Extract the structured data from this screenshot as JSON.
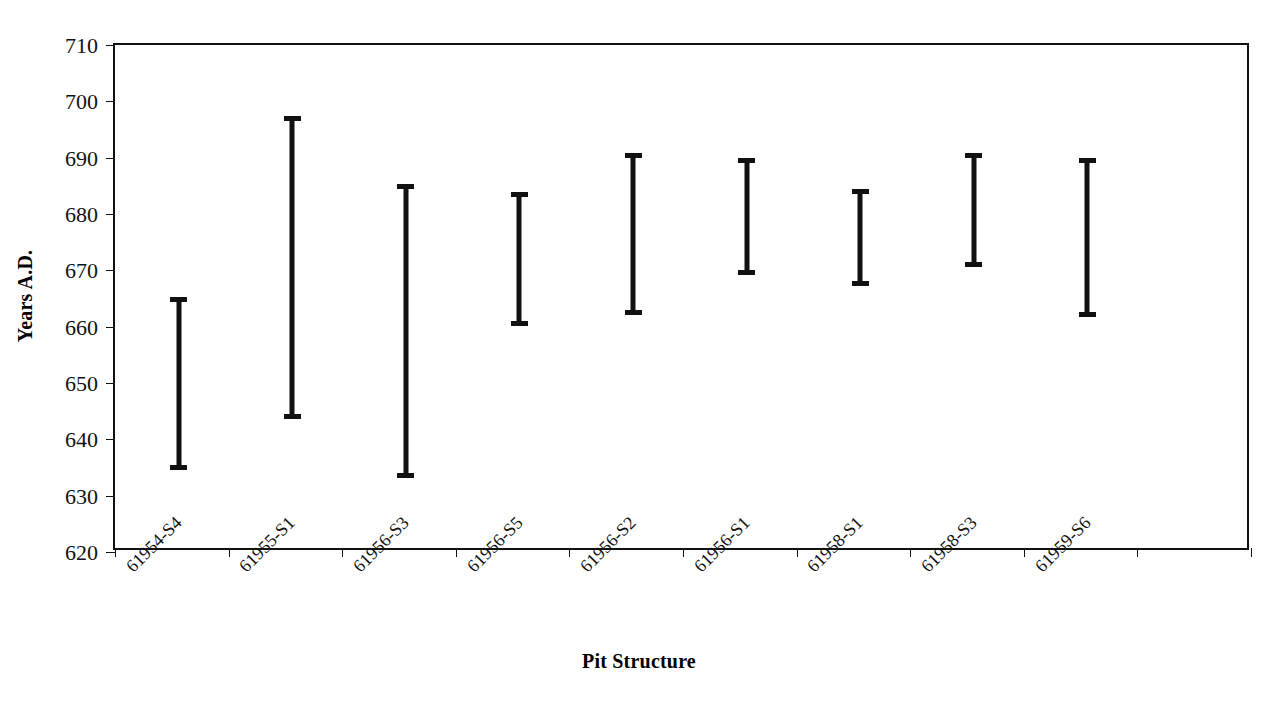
{
  "chart_data": {
    "type": "bar",
    "title": "",
    "xlabel": "Pit Structure",
    "ylabel": "Years A.D.",
    "ylim": [
      620,
      710
    ],
    "ytick_step": 10,
    "yticks": [
      710,
      700,
      690,
      680,
      670,
      660,
      650,
      640,
      630,
      620
    ],
    "grid": false,
    "legend": null,
    "orientation": "vertical",
    "value_kind": "range",
    "categories": [
      "61954-S4",
      "61955-S1",
      "61956-S3",
      "61956-S5",
      "61956-S2",
      "61956-S1",
      "61958-S1",
      "61958-S3",
      "61959-S6"
    ],
    "series": [
      {
        "name": "Date range",
        "low": [
          635,
          644,
          633.5,
          660.5,
          662.5,
          669.5,
          667.5,
          671,
          662
        ],
        "high": [
          665,
          697,
          685,
          683.5,
          690.5,
          689.5,
          684,
          690.5,
          689.5
        ]
      }
    ],
    "points": [
      {
        "category": "61954-S4",
        "low": 635,
        "high": 665
      },
      {
        "category": "61955-S1",
        "low": 644,
        "high": 697
      },
      {
        "category": "61956-S3",
        "low": 633.5,
        "high": 685
      },
      {
        "category": "61956-S5",
        "low": 660.5,
        "high": 683.5
      },
      {
        "category": "61956-S2",
        "low": 662.5,
        "high": 690.5
      },
      {
        "category": "61956-S1",
        "low": 669.5,
        "high": 689.5
      },
      {
        "category": "61958-S1",
        "low": 667.5,
        "high": 684
      },
      {
        "category": "61958-S3",
        "low": 671,
        "high": 690.5
      },
      {
        "category": "61959-S6",
        "low": 662,
        "high": 689.5
      }
    ],
    "colors": {
      "bar": "#111111",
      "axis": "#111111",
      "background": "#ffffff"
    }
  }
}
